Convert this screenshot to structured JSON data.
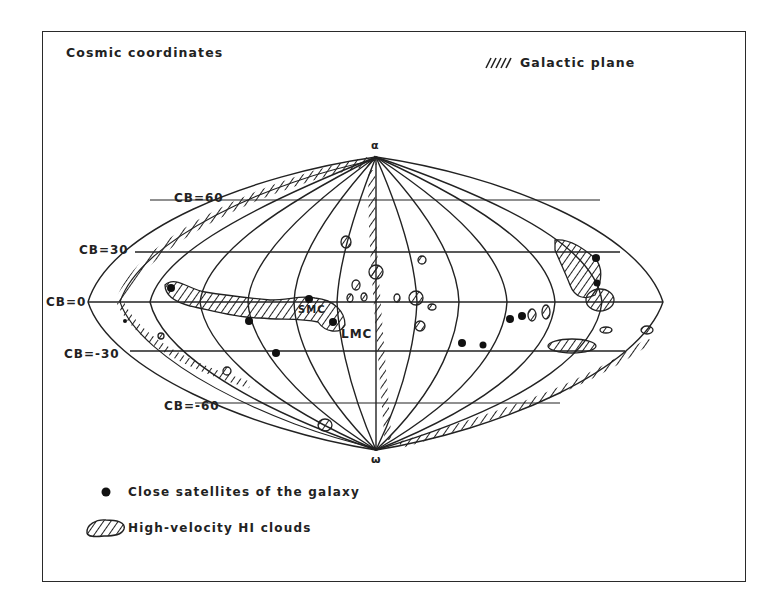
{
  "figure": {
    "title": "Cosmic coordinates",
    "plane_legend": {
      "symbol": "////",
      "label": "Galactic plane"
    },
    "pole_labels": {
      "top": "α",
      "bottom": "ω"
    },
    "latitude_labels": [
      {
        "text": "CB=60",
        "value": 60
      },
      {
        "text": "CB=30",
        "value": 30
      },
      {
        "text": "CB=0",
        "value": 0
      },
      {
        "text": "CB=-30",
        "value": -30
      },
      {
        "text": "CB=-60",
        "value": -60
      }
    ],
    "object_labels": {
      "smc": "SMC",
      "lmc": "LMC"
    },
    "legend": [
      {
        "symbol": "filled-dot",
        "label": "Close satellites of the galaxy"
      },
      {
        "symbol": "hatched-blob",
        "label": "High-velocity HI clouds"
      }
    ],
    "colors": {
      "ink": "#1f1f1f",
      "background": "#ffffff"
    }
  }
}
